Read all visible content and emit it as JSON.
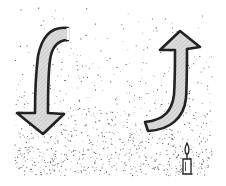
{
  "diagram": {
    "type": "convection-illustration",
    "elements": [
      {
        "name": "downward-arrow",
        "icon": "curved-arrow-down-icon",
        "position": "left"
      },
      {
        "name": "upward-arrow",
        "icon": "curved-arrow-up-icon",
        "position": "right"
      },
      {
        "name": "candle",
        "icon": "candle-icon",
        "position": "bottom-right"
      },
      {
        "name": "particles",
        "description": "stippled dots, denser toward bottom"
      }
    ],
    "colors": {
      "background": "#ffffff",
      "outline": "#222222",
      "arrow_fill": "#d4d4d4",
      "dots": "#555555"
    }
  }
}
